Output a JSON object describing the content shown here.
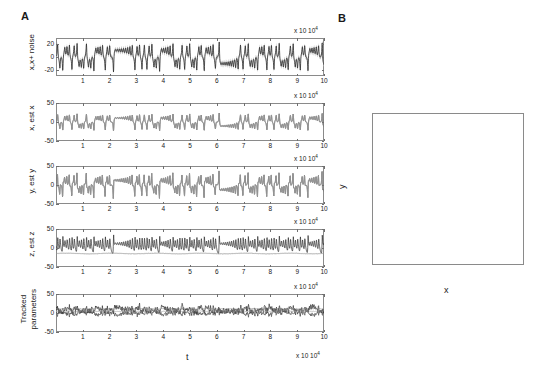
{
  "figure": {
    "panel_a_letter": "A",
    "panel_b_letter": "B"
  },
  "panelA": {
    "xlabel": "t",
    "x_exponent": "x 10",
    "x_exponent_sup": "4",
    "xticks": [
      "1",
      "2",
      "3",
      "4",
      "5",
      "6",
      "7",
      "8",
      "9",
      "10"
    ],
    "subplots": [
      {
        "id": "x-noise",
        "ylabel": "x,x+ noise",
        "ylabel_line1": "x,x+ noise",
        "ylabel_line2": "",
        "yticks": [
          "20",
          "0",
          "-20"
        ],
        "ylim": [
          -30,
          30
        ],
        "ytick_values": [
          20,
          0,
          -20
        ]
      },
      {
        "id": "x-estx",
        "ylabel": "x, est x",
        "ylabel_line1": "x, est x",
        "ylabel_line2": "",
        "yticks": [
          "50",
          "0",
          "-50"
        ],
        "ylim": [
          -50,
          50
        ],
        "ytick_values": [
          50,
          0,
          -50
        ]
      },
      {
        "id": "y-esty",
        "ylabel": "y, est y",
        "ylabel_line1": "y, est y",
        "ylabel_line2": "",
        "yticks": [
          "50",
          "0",
          "-50"
        ],
        "ylim": [
          -50,
          50
        ],
        "ytick_values": [
          50,
          0,
          -50
        ]
      },
      {
        "id": "z-estz",
        "ylabel": "z, est z",
        "ylabel_line1": "z, est z",
        "ylabel_line2": "",
        "yticks": [
          "50",
          "0",
          "-50"
        ],
        "ylim": [
          -50,
          50
        ],
        "ytick_values": [
          50,
          0,
          -50
        ]
      },
      {
        "id": "tracked-parameters",
        "ylabel": "Tracked parameters",
        "ylabel_line1": "Tracked",
        "ylabel_line2": "parameters",
        "yticks": [
          "50",
          "0",
          "-50"
        ],
        "ylim": [
          -50,
          50
        ],
        "ytick_values": [
          50,
          0,
          -50
        ]
      }
    ]
  },
  "panelB": {
    "xlabel": "x",
    "ylabel": "y",
    "xticks": [
      "-30",
      "-20",
      "-10",
      "0",
      "10",
      "20",
      "30"
    ],
    "yticks": [
      "50",
      "40",
      "30",
      "20",
      "10",
      "0",
      "-10",
      "-20",
      "-30",
      "-40",
      "-50"
    ],
    "xlim": [
      -30,
      30
    ],
    "ylim": [
      -50,
      50
    ]
  },
  "colors": {
    "signal_dark": "#2b2b2b",
    "signal_gray": "#9a9a9a",
    "noise_band": "#b4b4b4",
    "axis": "#8a8a8a",
    "text": "#1a1a1a",
    "attractor_dark": "#1d1d1d",
    "attractor_light": "#a9a9a9",
    "background": "#ffffff"
  },
  "chart_data": {
    "type": "line",
    "title": "",
    "panels": [
      {
        "name": "x,x+ noise",
        "type": "line",
        "xlabel": "t",
        "ylabel": "x,x+ noise",
        "xlim": [
          0,
          100000
        ],
        "ylim": [
          -30,
          30
        ],
        "xtick_values": [
          10000,
          20000,
          30000,
          40000,
          50000,
          60000,
          70000,
          80000,
          90000,
          100000
        ],
        "ytick_values": [
          20,
          0,
          -20
        ],
        "series": [
          {
            "name": "x + noise band (upper)",
            "color": "#b4b4b4",
            "note": "gray noise envelope approximately +-4 around x"
          },
          {
            "name": "x (true state)",
            "color": "#2b2b2b",
            "x": [
              0,
              1500,
              3000,
              5000,
              7000,
              9000,
              11000,
              13000,
              15000,
              16500,
              18000,
              20000,
              21500,
              23000,
              25000,
              27000,
              29000,
              31000,
              32000,
              32500,
              33000,
              34000,
              36000,
              38000,
              40000,
              42000,
              44000,
              46000,
              48000,
              50000,
              52000,
              54000,
              56000,
              57000,
              58000,
              60000,
              61500,
              63000,
              65000,
              66500,
              68000,
              70000,
              72000,
              74000,
              76000,
              78000,
              79500,
              80500,
              81500,
              83000,
              85000,
              87000,
              89000,
              91000,
              93000,
              95000,
              97000,
              99000,
              100000
            ],
            "y": [
              2,
              -4,
              24,
              -2,
              -14,
              -6,
              -16,
              -4,
              -18,
              -22,
              -4,
              6,
              18,
              4,
              -2,
              -8,
              -9,
              -9,
              -18,
              -28,
              -12,
              14,
              12,
              16,
              11,
              16,
              10,
              15,
              9,
              17,
              10,
              19,
              14,
              21,
              6,
              -16,
              -24,
              -12,
              -22,
              2,
              18,
              7,
              14,
              6,
              13,
              -14,
              -26,
              -30,
              -6,
              12,
              8,
              14,
              7,
              13,
              6,
              12,
              7,
              13,
              15
            ]
          }
        ]
      },
      {
        "name": "x, est x",
        "type": "line",
        "xlabel": "t",
        "ylabel": "x, est x",
        "xlim": [
          0,
          100000
        ],
        "ylim": [
          -50,
          50
        ],
        "xtick_values": [
          10000,
          20000,
          30000,
          40000,
          50000,
          60000,
          70000,
          80000,
          90000,
          100000
        ],
        "ytick_values": [
          50,
          0,
          -50
        ],
        "series": [
          {
            "name": "x",
            "color": "#2b2b2b",
            "note": "true x, overlapped by estimate"
          },
          {
            "name": "est x",
            "color": "#9a9a9a",
            "x": [
              0,
              1500,
              3000,
              5000,
              7000,
              9000,
              11000,
              13000,
              15000,
              16500,
              18000,
              20000,
              21500,
              23000,
              25000,
              27000,
              29000,
              31000,
              32000,
              32500,
              33000,
              34000,
              36000,
              38000,
              40000,
              42000,
              44000,
              46000,
              48000,
              50000,
              52000,
              54000,
              56000,
              57000,
              58000,
              60000,
              61500,
              63000,
              65000,
              66500,
              68000,
              70000,
              72000,
              74000,
              76000,
              78000,
              79500,
              80500,
              81500,
              83000,
              85000,
              87000,
              89000,
              91000,
              93000,
              95000,
              97000,
              99000,
              100000
            ],
            "y": [
              2,
              -4,
              24,
              -2,
              -14,
              -6,
              -16,
              -4,
              -18,
              -22,
              -4,
              6,
              18,
              4,
              -2,
              -8,
              -9,
              -9,
              -18,
              -28,
              -12,
              14,
              12,
              16,
              11,
              16,
              10,
              15,
              9,
              17,
              10,
              19,
              14,
              21,
              6,
              -16,
              -24,
              -12,
              -22,
              2,
              18,
              7,
              14,
              6,
              13,
              -14,
              -26,
              -30,
              -6,
              12,
              8,
              14,
              7,
              13,
              6,
              12,
              7,
              13,
              15
            ]
          }
        ]
      },
      {
        "name": "y, est y",
        "type": "line",
        "xlabel": "t",
        "ylabel": "y, est y",
        "xlim": [
          0,
          100000
        ],
        "ylim": [
          -50,
          50
        ],
        "xtick_values": [
          10000,
          20000,
          30000,
          40000,
          50000,
          60000,
          70000,
          80000,
          90000,
          100000
        ],
        "ytick_values": [
          50,
          0,
          -50
        ],
        "series": [
          {
            "name": "y",
            "color": "#2b2b2b",
            "x": [
              0,
              1200,
              2500,
              4000,
              6000,
              8000,
              10000,
              12000,
              14000,
              16000,
              17500,
              19000,
              21000,
              22500,
              24000,
              26000,
              28000,
              30000,
              31500,
              32000,
              33000,
              34500,
              36000,
              38000,
              40000,
              41000,
              42500,
              44000,
              46000,
              48000,
              50000,
              52000,
              54000,
              56000,
              57000,
              58500,
              60000,
              62000,
              63500,
              65000,
              66500,
              68000,
              70000,
              72000,
              74000,
              76000,
              78000,
              79500,
              81000,
              82000,
              84000,
              86000,
              88000,
              90000,
              91500,
              93000,
              95000,
              97000,
              99000,
              100000
            ],
            "y": [
              4,
              -10,
              26,
              -4,
              -20,
              -8,
              -24,
              -6,
              -26,
              -32,
              -6,
              10,
              24,
              6,
              -4,
              -12,
              -14,
              -13,
              -28,
              -40,
              -18,
              20,
              18,
              24,
              16,
              22,
              14,
              21,
              13,
              24,
              14,
              26,
              19,
              29,
              8,
              -22,
              -34,
              -17,
              -31,
              3,
              25,
              10,
              20,
              8,
              18,
              -20,
              -36,
              -42,
              -9,
              17,
              11,
              20,
              10,
              19,
              8,
              17,
              10,
              19,
              22,
              24
            ]
          },
          {
            "name": "est y",
            "color": "#9a9a9a",
            "note": "estimate closely overlapping true y"
          }
        ]
      },
      {
        "name": "z, est z",
        "type": "line",
        "xlabel": "t",
        "ylabel": "z, est z",
        "xlim": [
          0,
          100000
        ],
        "ylim": [
          -50,
          50
        ],
        "xtick_values": [
          10000,
          20000,
          30000,
          40000,
          50000,
          60000,
          70000,
          80000,
          90000,
          100000
        ],
        "ytick_values": [
          50,
          0,
          -50
        ],
        "series": [
          {
            "name": "z",
            "color": "#2b2b2b",
            "x": [
              0,
              1000,
              2000,
              3000,
              5000,
              7000,
              9000,
              11000,
              13000,
              15000,
              17000,
              19000,
              21000,
              23000,
              25000,
              27000,
              29000,
              31000,
              32000,
              33000,
              34000,
              36000,
              38000,
              40000,
              42000,
              44000,
              46000,
              48000,
              50000,
              52000,
              54000,
              56000,
              58000,
              60000,
              62000,
              64000,
              66000,
              68000,
              70000,
              72000,
              74000,
              76000,
              78000,
              80000,
              81000,
              82000,
              84000,
              86000,
              88000,
              90000,
              92000,
              94000,
              96000,
              98000,
              100000
            ],
            "y": [
              5,
              40,
              12,
              20,
              8,
              16,
              6,
              22,
              7,
              14,
              6,
              18,
              6,
              20,
              7,
              14,
              5,
              12,
              30,
              34,
              10,
              18,
              7,
              16,
              6,
              18,
              6,
              14,
              5,
              20,
              6,
              22,
              8,
              16,
              6,
              18,
              7,
              14,
              5,
              16,
              6,
              12,
              5,
              35,
              30,
              12,
              18,
              6,
              14,
              5,
              16,
              6,
              13,
              6,
              12
            ]
          },
          {
            "name": "est z",
            "color": "#9a9a9a",
            "note": "nearly flat trace around -15",
            "x": [
              0,
              10000,
              20000,
              30000,
              40000,
              50000,
              60000,
              70000,
              80000,
              90000,
              100000
            ],
            "y": [
              -14,
              -15,
              -14,
              -15,
              -14,
              -15,
              -14,
              -15,
              -14,
              -15,
              -14
            ]
          }
        ]
      },
      {
        "name": "Tracked parameters",
        "type": "line",
        "xlabel": "t",
        "ylabel": "Tracked parameters",
        "xlim": [
          0,
          100000
        ],
        "ylim": [
          -50,
          50
        ],
        "xtick_values": [
          10000,
          20000,
          30000,
          40000,
          50000,
          60000,
          70000,
          80000,
          90000,
          100000
        ],
        "ytick_values": [
          50,
          0,
          -50
        ],
        "series": [
          {
            "name": "param 1",
            "color": "#2b2b2b",
            "note": "noisy oscillation, mean approx 8, range -30..50"
          },
          {
            "name": "param 2",
            "color": "#555555",
            "note": "noisy oscillation, mean approx 2, range -25..30"
          },
          {
            "name": "param 3",
            "color": "#8a8a8a",
            "note": "near flat around 10"
          },
          {
            "name": "param 4",
            "color": "#9a9a9a",
            "note": "near flat around 5"
          }
        ]
      }
    ],
    "panelB": {
      "type": "line",
      "name": "phase portrait",
      "xlabel": "x",
      "ylabel": "y",
      "xlim": [
        -30,
        30
      ],
      "ylim": [
        -50,
        50
      ],
      "xtick_values": [
        -30,
        -20,
        -10,
        0,
        10,
        20,
        30
      ],
      "ytick_values": [
        50,
        40,
        30,
        20,
        10,
        0,
        -10,
        -20,
        -30,
        -40,
        -50
      ],
      "series": [
        {
          "name": "tracked trajectory",
          "color": "#1d1d1d",
          "note": "dense double-lobed (butterfly) attractor oriented along the diagonal"
        },
        {
          "name": "model envelope",
          "color": "#a9a9a9",
          "note": "two light-gray outer loops bounding the attractor"
        }
      ]
    }
  }
}
